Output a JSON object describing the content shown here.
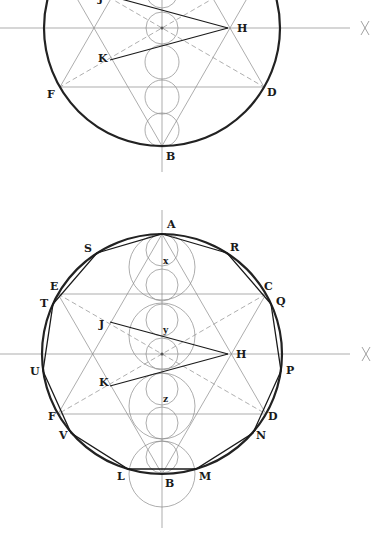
{
  "colors": {
    "background": "#ffffff",
    "main_circle": "#222222",
    "construction": "#8a8a8a",
    "dashed": "#9a9a9a",
    "polygon": "#1a1a1a",
    "label": "#1a1a1a"
  },
  "figures": [
    {
      "name": "top-figure",
      "center": [
        162,
        28
      ],
      "radius": 118,
      "axis_h": {
        "x1": 0,
        "x2": 350,
        "mark_x": 365
      },
      "axis_v": {
        "y1": -10,
        "y2": 172
      },
      "hexagram_points": {
        "B": [
          162,
          146
        ],
        "F": [
          60,
          87
        ],
        "D": [
          264,
          87
        ],
        "A": [
          162,
          -90
        ],
        "E": [
          60,
          -31
        ],
        "C": [
          264,
          -31
        ]
      },
      "H": [
        228,
        28
      ],
      "J": [
        110,
        -4
      ],
      "K": [
        110,
        60
      ],
      "axis_circles": [
        {
          "cy": -8,
          "r": 16
        },
        {
          "cy": 28,
          "r": 16
        },
        {
          "cy": 62,
          "r": 17
        },
        {
          "cy": 97,
          "r": 17
        },
        {
          "cy": 130,
          "r": 17
        }
      ],
      "labels": [
        {
          "text": "J",
          "x": 98,
          "y": 2
        },
        {
          "text": "H",
          "x": 237,
          "y": 32
        },
        {
          "text": "K",
          "x": 98,
          "y": 62
        },
        {
          "text": "F",
          "x": 47,
          "y": 98
        },
        {
          "text": "D",
          "x": 267,
          "y": 96
        },
        {
          "text": "B",
          "x": 166,
          "y": 160
        }
      ]
    },
    {
      "name": "bottom-figure",
      "center": [
        162,
        354
      ],
      "radius": 120,
      "axis_h": {
        "x1": 0,
        "x2": 350,
        "mark_x": 366
      },
      "axis_v": {
        "y1": 210,
        "y2": 528
      },
      "hexagram_points": {
        "A": [
          162,
          234
        ],
        "C": [
          266,
          294
        ],
        "D": [
          266,
          414
        ],
        "B": [
          162,
          474
        ],
        "F": [
          58,
          414
        ],
        "E": [
          58,
          294
        ]
      },
      "H": [
        228,
        354
      ],
      "J": [
        110,
        322
      ],
      "K": [
        110,
        386
      ],
      "axis_circles_small": [
        {
          "cy": 250,
          "r": 16
        },
        {
          "cy": 285,
          "r": 16
        },
        {
          "cy": 320,
          "r": 16
        },
        {
          "cy": 354,
          "r": 16
        },
        {
          "cy": 389,
          "r": 16
        },
        {
          "cy": 423,
          "r": 16
        },
        {
          "cy": 457,
          "r": 16
        }
      ],
      "axis_circles_large": [
        {
          "cy": 267,
          "r": 33
        },
        {
          "cy": 336,
          "r": 33
        },
        {
          "cy": 406,
          "r": 33
        },
        {
          "cy": 474,
          "r": 33
        }
      ],
      "hendecagon": [
        {
          "name": "A",
          "p": [
            162,
            234
          ]
        },
        {
          "name": "R",
          "p": [
            227,
            253
          ]
        },
        {
          "name": "Q",
          "p": [
            271,
            304
          ]
        },
        {
          "name": "P",
          "p": [
            281,
            371
          ]
        },
        {
          "name": "N",
          "p": [
            253,
            433
          ]
        },
        {
          "name": "M",
          "p": [
            196,
            469
          ]
        },
        {
          "name": "L",
          "p": [
            128,
            469
          ]
        },
        {
          "name": "V",
          "p": [
            71,
            433
          ]
        },
        {
          "name": "U",
          "p": [
            43,
            371
          ]
        },
        {
          "name": "T",
          "p": [
            53,
            304
          ]
        },
        {
          "name": "S",
          "p": [
            97,
            253
          ]
        }
      ],
      "labels": [
        {
          "text": "A",
          "x": 167,
          "y": 228
        },
        {
          "text": "R",
          "x": 230,
          "y": 251
        },
        {
          "text": "S",
          "x": 84,
          "y": 252
        },
        {
          "text": "C",
          "x": 264,
          "y": 290
        },
        {
          "text": "Q",
          "x": 276,
          "y": 305
        },
        {
          "text": "E",
          "x": 50,
          "y": 290
        },
        {
          "text": "T",
          "x": 40,
          "y": 307
        },
        {
          "text": "J",
          "x": 99,
          "y": 328
        },
        {
          "text": "H",
          "x": 236,
          "y": 358
        },
        {
          "text": "P",
          "x": 286,
          "y": 374
        },
        {
          "text": "U",
          "x": 30,
          "y": 375
        },
        {
          "text": "K",
          "x": 99,
          "y": 386
        },
        {
          "text": "D",
          "x": 268,
          "y": 420
        },
        {
          "text": "F",
          "x": 48,
          "y": 420
        },
        {
          "text": "N",
          "x": 256,
          "y": 439
        },
        {
          "text": "V",
          "x": 59,
          "y": 439
        },
        {
          "text": "L",
          "x": 117,
          "y": 480
        },
        {
          "text": "M",
          "x": 199,
          "y": 480
        },
        {
          "text": "B",
          "x": 165,
          "y": 487
        }
      ],
      "small_labels": [
        {
          "text": "x",
          "x": 163,
          "y": 264
        },
        {
          "text": "y",
          "x": 163,
          "y": 333
        },
        {
          "text": "z",
          "x": 163,
          "y": 402
        }
      ]
    }
  ]
}
